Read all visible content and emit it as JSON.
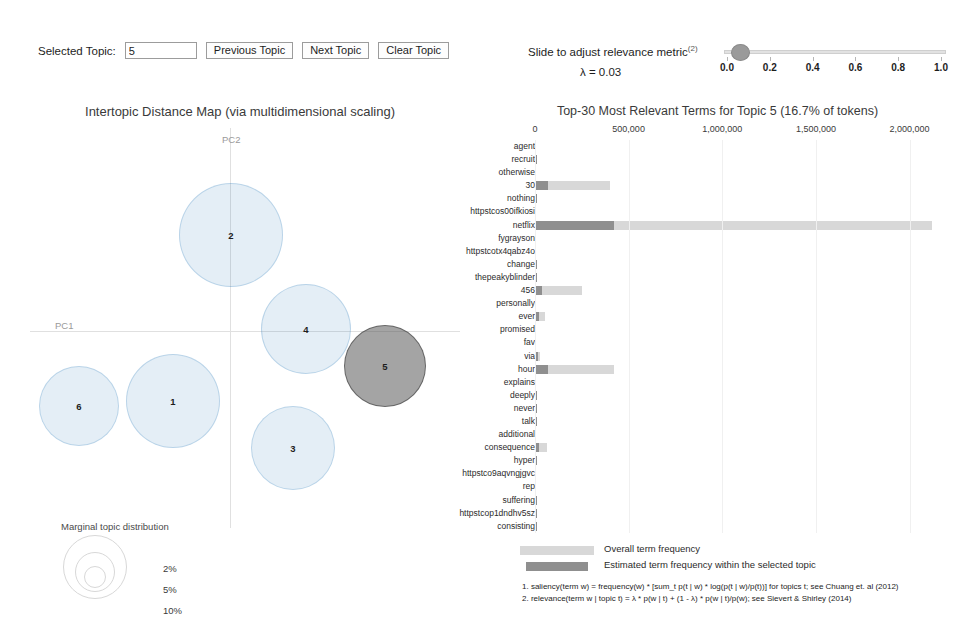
{
  "controls": {
    "selected_topic_label": "Selected Topic:",
    "selected_topic_value": "5",
    "previous_topic_label": "Previous Topic",
    "next_topic_label": "Next Topic",
    "clear_topic_label": "Clear Topic"
  },
  "slider": {
    "caption": "Slide to adjust relevance metric",
    "caption_superscript": "(2)",
    "lambda_readout": "λ = 0.03",
    "value": 0.03,
    "min": 0.0,
    "max": 1.0,
    "ticks": [
      "0.0",
      "0.2",
      "0.4",
      "0.6",
      "0.8",
      "1.0"
    ]
  },
  "intertopic": {
    "title": "Intertopic Distance Map (via multidimensional scaling)",
    "axis_x_label": "PC1",
    "axis_y_label": "PC2",
    "marginal_legend_title": "Marginal topic distribution",
    "marginal_percents": [
      "2%",
      "5%",
      "10%"
    ],
    "topics": [
      {
        "id": "1",
        "x": 143,
        "y": 273,
        "r": 47,
        "selected": false
      },
      {
        "id": "2",
        "x": 201,
        "y": 107,
        "r": 52,
        "selected": false
      },
      {
        "id": "3",
        "x": 263,
        "y": 320,
        "r": 42,
        "selected": false
      },
      {
        "id": "4",
        "x": 276,
        "y": 201,
        "r": 45,
        "selected": false
      },
      {
        "id": "5",
        "x": 355,
        "y": 238,
        "r": 41,
        "selected": true
      },
      {
        "id": "6",
        "x": 49,
        "y": 278,
        "r": 40,
        "selected": false
      }
    ]
  },
  "chart_data": {
    "type": "bar",
    "title": "Top-30 Most Relevant Terms for Topic 5 (16.7% of tokens)",
    "xlabel": "",
    "ylabel": "",
    "xlim": [
      0,
      2200000
    ],
    "xticks": [
      0,
      500000,
      1000000,
      1500000,
      2000000
    ],
    "xtick_labels": [
      "0",
      "500,000",
      "1,000,000",
      "1,500,000",
      "2,000,000"
    ],
    "grid": true,
    "legend_position": "bottom",
    "series": [
      {
        "name": "Overall term frequency",
        "color": "#d8d8d8"
      },
      {
        "name": "Estimated term frequency within the selected topic",
        "color": "#8f8f8f"
      }
    ],
    "categories": [
      "agent",
      "recruit",
      "otherwise",
      "30",
      "nothing",
      "httpstcos00ifkiosi",
      "netflix",
      "fygrayson",
      "httpstcotx4qabz4o",
      "change",
      "thepeakyblinder",
      "456",
      "personally",
      "ever",
      "promised",
      "fav",
      "via",
      "hour",
      "explains",
      "deeply",
      "never",
      "talk",
      "additional",
      "consequence",
      "hyper",
      "httpstco9aqvngjgvc",
      "rep",
      "suffering",
      "httpstcop1dndhv5sz",
      "consisting"
    ],
    "overall_frequency": [
      6000,
      9000,
      6000,
      400000,
      9000,
      6000,
      2120000,
      6000,
      6000,
      9000,
      9000,
      250000,
      6000,
      52000,
      6000,
      6000,
      26000,
      420000,
      6000,
      9000,
      9000,
      9000,
      6000,
      62000,
      9000,
      6000,
      6000,
      9000,
      9000,
      9000
    ],
    "topic_frequency": [
      6000,
      9000,
      6000,
      70000,
      9000,
      6000,
      420000,
      6000,
      6000,
      9000,
      9000,
      38000,
      6000,
      22000,
      6000,
      6000,
      17000,
      72000,
      6000,
      9000,
      9000,
      9000,
      6000,
      24000,
      9000,
      6000,
      6000,
      9000,
      9000,
      9000
    ]
  },
  "footnotes": [
    "1. saliency(term w) = frequency(w) * [sum_t p(t | w) * log(p(t | w)/p(t))] for topics t; see Chuang et. al (2012)",
    "2. relevance(term w | topic t) = λ * p(w | t) + (1 - λ) * p(w | t)/p(w); see Sievert & Shirley (2014)"
  ]
}
